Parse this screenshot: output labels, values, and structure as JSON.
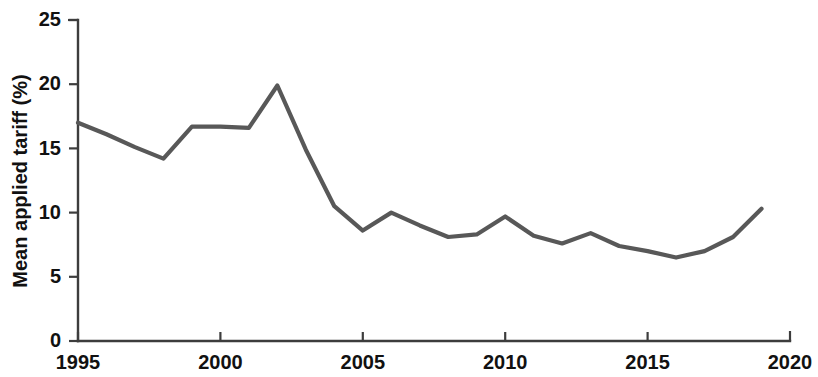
{
  "chart_data": {
    "type": "line",
    "title": "",
    "xlabel": "",
    "ylabel": "Mean applied tariff (%)",
    "x": [
      1995,
      1996,
      1997,
      1998,
      1999,
      2000,
      2001,
      2002,
      2003,
      2004,
      2005,
      2006,
      2007,
      2008,
      2009,
      2010,
      2011,
      2012,
      2013,
      2014,
      2015,
      2016,
      2017,
      2018,
      2019
    ],
    "values": [
      17.0,
      16.1,
      15.1,
      14.2,
      16.7,
      16.7,
      16.6,
      19.9,
      14.9,
      10.5,
      8.6,
      10.0,
      9.0,
      8.1,
      8.3,
      9.7,
      8.2,
      7.6,
      8.4,
      7.4,
      7.0,
      6.5,
      7.0,
      8.1,
      10.3
    ],
    "series": [
      {
        "name": "Mean applied tariff",
        "color": "#585858",
        "values": [
          17.0,
          16.1,
          15.1,
          14.2,
          16.7,
          16.7,
          16.6,
          19.9,
          14.9,
          10.5,
          8.6,
          10.0,
          9.0,
          8.1,
          8.3,
          9.7,
          8.2,
          7.6,
          8.4,
          7.4,
          7.0,
          6.5,
          7.0,
          8.1,
          10.3
        ]
      }
    ],
    "xlim": [
      1995,
      2020
    ],
    "ylim": [
      0,
      25
    ],
    "x_ticks": [
      1995,
      2000,
      2005,
      2010,
      2015,
      2020
    ],
    "x_tick_labels": [
      "1995",
      "2000",
      "2005",
      "2010",
      "2015",
      "2020"
    ],
    "y_ticks": [
      0,
      5,
      10,
      15,
      20,
      25
    ],
    "y_tick_labels": [
      "0",
      "5",
      "10",
      "15",
      "20",
      "25"
    ],
    "grid": false,
    "legend": null,
    "legend_position": "none",
    "line_color": "#585858",
    "axis_color": "#3d3d3d"
  }
}
